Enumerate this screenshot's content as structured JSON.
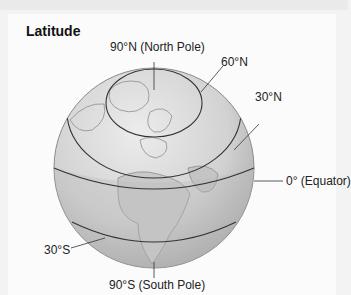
{
  "title": "Latitude",
  "labels": {
    "north_pole": "90°N (North Pole)",
    "lat60n": "60°N",
    "lat30n": "30°N",
    "equator": "0° (Equator)",
    "lat30s": "30°S",
    "south_pole": "90°S (South Pole)"
  },
  "colors": {
    "globe_light": "#e2e2e2",
    "globe_dark": "#a9a9a9",
    "line": "#333333"
  }
}
